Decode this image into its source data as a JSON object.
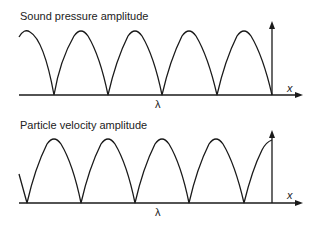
{
  "diagram": {
    "panels": [
      {
        "title": "Sound pressure amplitude",
        "x_axis_label": "x",
        "marker_label": "λ",
        "description": "Rectified standing-wave amplitude; maxima at the closed end (vertical axis), nodes spaced half a wavelength apart"
      },
      {
        "title": "Particle velocity amplitude",
        "x_axis_label": "x",
        "marker_label": "λ",
        "description": "Rectified standing-wave amplitude shifted by a quarter wavelength; node at the closed end"
      }
    ],
    "colors": {
      "line": "#1a1a1a",
      "background": "#ffffff"
    }
  }
}
